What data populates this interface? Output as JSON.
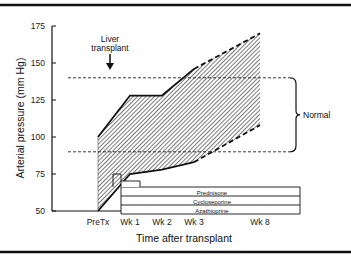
{
  "chart_data": {
    "type": "area",
    "title": "",
    "xlabel": "Time after transplant",
    "ylabel": "Arterial pressure (mm Hg)",
    "ylim": [
      50,
      175
    ],
    "yticks": [
      50,
      75,
      100,
      125,
      150,
      175
    ],
    "categories": [
      "PreTx",
      "Wk 1",
      "Wk 2",
      "Wk 3",
      "Wk 8"
    ],
    "series": [
      {
        "name": "Upper bound",
        "values": [
          100,
          128,
          128,
          146,
          170
        ],
        "dashed_after": "Wk 3"
      },
      {
        "name": "Lower bound",
        "values": [
          50,
          75,
          78,
          83,
          108
        ],
        "dashed_after": "Wk 3"
      }
    ],
    "normal_range": {
      "label": "Normal",
      "low": 90,
      "high": 140
    },
    "annotations": [
      {
        "text_line1": "Liver",
        "text_line2": "transplant",
        "at": "PreTx"
      }
    ],
    "drug_bars": [
      {
        "label": "Prednisone"
      },
      {
        "label": "Cycloseporine"
      },
      {
        "label": "Azathioprine"
      }
    ],
    "grid": false,
    "legend": "none"
  }
}
